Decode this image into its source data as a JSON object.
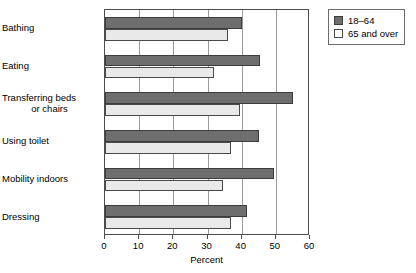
{
  "chart_data": {
    "type": "bar",
    "orientation": "horizontal",
    "title": "",
    "xlabel": "Percent",
    "ylabel": "",
    "xlim": [
      0,
      60
    ],
    "xticks": [
      0,
      10,
      20,
      30,
      40,
      50,
      60
    ],
    "xtick_labels": [
      "0",
      "10",
      "20",
      "30",
      "40",
      "50",
      "60"
    ],
    "grid": "vertical",
    "legend_position": "top-right",
    "categories": [
      "Bathing",
      "Eating",
      "Transferring beds\nor chairs",
      "Using toilet",
      "Mobility indoors",
      "Dressing"
    ],
    "series": [
      {
        "name": "18–64",
        "color": "#6e6e6e",
        "values": [
          40.0,
          45.5,
          55.0,
          45.0,
          49.5,
          41.5
        ]
      },
      {
        "name": "65 and over",
        "color": "#e9e9e9",
        "values": [
          36.0,
          32.0,
          39.5,
          37.0,
          34.5,
          37.0
        ]
      }
    ]
  },
  "legend": {
    "items": [
      {
        "label": "18–64"
      },
      {
        "label": "65 and over"
      }
    ]
  },
  "axis": {
    "x_title": "Percent"
  }
}
